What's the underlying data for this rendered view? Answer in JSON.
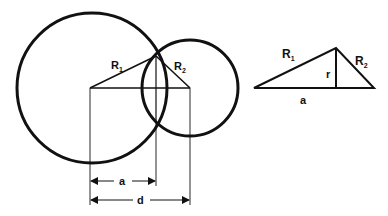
{
  "diagram": {
    "colors": {
      "stroke": "#111111",
      "background": "#ffffff"
    },
    "left_figure": {
      "circle1_label": "R",
      "circle1_sub": "1",
      "circle2_label": "R",
      "circle2_sub": "2",
      "dim_a": "a",
      "dim_d": "d"
    },
    "right_figure": {
      "hyp1_label": "R",
      "hyp1_sub": "1",
      "hyp2_label": "R",
      "hyp2_sub": "2",
      "height_label": "r",
      "base_label": "a"
    }
  }
}
